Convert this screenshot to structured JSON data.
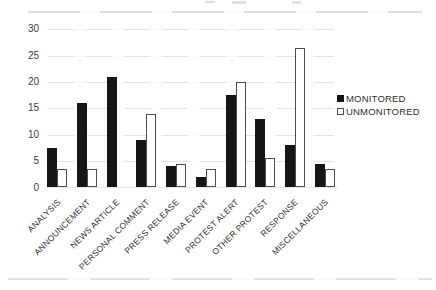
{
  "chart_data": {
    "type": "bar",
    "title": "",
    "xlabel": "",
    "ylabel": "",
    "categories": [
      "ANALYSIS",
      "ANNOUNCEMENT",
      "NEWS ARTICLE",
      "PERSONAL COMMENT",
      "PRESS RELEASE",
      "MEDIA EVENT",
      "PROTEST ALERT",
      "OTHER PROTEST",
      "RESPONSE",
      "MISCELLANEOUS"
    ],
    "series": [
      {
        "name": "MONITORED",
        "fill": "solid-black",
        "values": [
          7.5,
          16,
          21,
          9,
          4,
          2,
          17.5,
          13,
          8,
          4.5
        ]
      },
      {
        "name": "UNMONITORED",
        "fill": "white-outlined",
        "values": [
          3.5,
          3.5,
          0,
          14,
          4.5,
          3.5,
          20,
          5.5,
          26.5,
          3.5
        ]
      }
    ],
    "y_ticks": [
      0,
      5,
      10,
      15,
      20,
      25,
      30
    ],
    "ylim": [
      0,
      30
    ],
    "grid": "faint horizontal gridlines at ticks",
    "legend_position": "right",
    "x_label_rotation_deg": 45,
    "colors": {
      "monitored_fill": "#161616",
      "unmonitored_fill": "#ffffff",
      "bar_outline": "#4d4d4d",
      "text": "#2e2e2e",
      "background": "#ffffff"
    }
  }
}
